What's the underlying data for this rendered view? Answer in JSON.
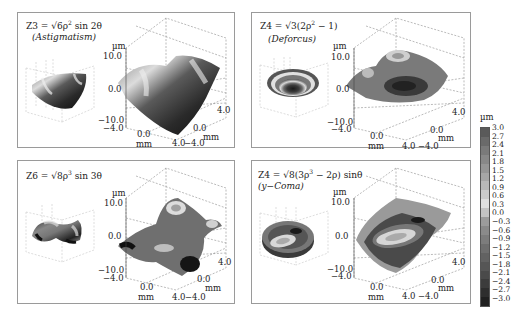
{
  "chart_data": {
    "type": "surface3d",
    "colorbar": {
      "label": "µm",
      "ticks": [
        "3.0",
        "2.7",
        "2.4",
        "2.1",
        "1.8",
        "1.5",
        "1.2",
        "0.9",
        "0.6",
        "0.3",
        "0.0",
        "-0.3",
        "-0.6",
        "-0.9",
        "-1.2",
        "-1.5",
        "-1.8",
        "-2.1",
        "-2.4",
        "-2.7",
        "-3.0"
      ],
      "range": [
        -3.0,
        3.0
      ],
      "colormap": "grayscale (dark = low, light = high)"
    },
    "panels": [
      {
        "position": "top-left",
        "equation": "Z3 = √6ρ² sin 2θ",
        "name": "(Astigmatism)",
        "zlabel": "µm",
        "zticks": [
          "10.0",
          "0.0",
          "-10.0"
        ],
        "zlim": [
          -10.0,
          10.0
        ],
        "xlabel": "mm",
        "xticks": [
          "-4.0",
          "0.0",
          "4.0"
        ],
        "xlim": [
          -4.0,
          4.0
        ],
        "ylabel": "mm",
        "yticks": [
          "4.0",
          "0.0",
          "-4.0"
        ],
        "ylim": [
          -4.0,
          4.0
        ]
      },
      {
        "position": "top-right",
        "equation": "Z4 = √3(2ρ² − 1)",
        "name": "(Deforcus)",
        "zlabel": "µm",
        "zticks": [
          "10.0",
          "0.0",
          "-10.0"
        ],
        "zlim": [
          -10.0,
          10.0
        ],
        "xlabel": "mm",
        "xticks": [
          "-4.0",
          "0.0",
          "4.0"
        ],
        "xlim": [
          -4.0,
          4.0
        ],
        "ylabel": "mm",
        "yticks": [
          "4.0",
          "0.0",
          "-4.0"
        ],
        "ylim": [
          -4.0,
          4.0
        ]
      },
      {
        "position": "bottom-left",
        "equation": "Z6 = √8ρ³ sin 3θ",
        "name": "",
        "zlabel": "µm",
        "zticks": [
          "10.0",
          "0.0",
          "-10.0"
        ],
        "zlim": [
          -10.0,
          10.0
        ],
        "xlabel": "mm",
        "xticks": [
          "-4.0",
          "0.0",
          "4.0"
        ],
        "xlim": [
          -4.0,
          4.0
        ],
        "ylabel": "mm",
        "yticks": [
          "4.0",
          "0.0",
          "-4.0"
        ],
        "ylim": [
          -4.0,
          4.0
        ]
      },
      {
        "position": "bottom-right",
        "equation": "Z4 = √8(3ρ³ − 2ρ) sinθ",
        "name": "(y−Coma)",
        "zlabel": "µm",
        "zticks": [
          "10.0",
          "0.0",
          "-10.0"
        ],
        "zlim": [
          -10.0,
          10.0
        ],
        "xlabel": "mm",
        "xticks": [
          "-4.0",
          "0.0",
          "4.0"
        ],
        "xlim": [
          -4.0,
          4.0
        ],
        "ylabel": "mm",
        "yticks": [
          "4.0",
          "0.0",
          "-4.0"
        ],
        "ylim": [
          -4.0,
          4.0
        ]
      }
    ]
  },
  "panels": [
    {
      "eq_lhs": "Z3 = √6ρ",
      "eq_sup": "2",
      "eq_rhs": " sin 2θ",
      "name": "(Astigmatism)",
      "zlabel": "µm",
      "z_hi": "10.0",
      "z_mid": "0.0",
      "z_lo": "−10.0",
      "x_lo": "−4.0",
      "x_mid": "0.0",
      "x_hi": "4.0",
      "x_unit": "mm",
      "y_hi": "4.0",
      "y_mid": "0.0",
      "y_lo": "−4.0",
      "y_unit": "mm"
    },
    {
      "eq_lhs": "Z4 = √3(2ρ",
      "eq_sup": "2",
      "eq_rhs": " − 1)",
      "name": "(Deforcus)",
      "zlabel": "µm",
      "z_hi": "10.0",
      "z_mid": "0.0",
      "z_lo": "−10.0",
      "x_lo": "−4.0",
      "x_mid": "0.0",
      "x_hi": "4.0",
      "x_unit": "mm",
      "y_hi": "4.0",
      "y_mid": "0.0",
      "y_lo": "−4.0",
      "y_unit": "mm"
    },
    {
      "eq_lhs": "Z6 = √8ρ",
      "eq_sup": "3",
      "eq_rhs": " sin 3θ",
      "name": "",
      "zlabel": "µm",
      "z_hi": "10.0",
      "z_mid": "0.0",
      "z_lo": "−10.0",
      "x_lo": "−4.0",
      "x_mid": "0.0",
      "x_hi": "4.0",
      "x_unit": "mm",
      "y_hi": "4.0",
      "y_mid": "0.0",
      "y_lo": "−4.0",
      "y_unit": "mm"
    },
    {
      "eq_lhs": "Z4 = √8(3ρ",
      "eq_sup": "3",
      "eq_rhs": " − 2ρ) sinθ",
      "name": "(y−Coma)",
      "zlabel": "µm",
      "z_hi": "10.0",
      "z_mid": "0.0",
      "z_lo": "−10.0",
      "x_lo": "−4.0",
      "x_mid": "0.0",
      "x_hi": "4.0",
      "x_unit": "mm",
      "y_hi": "4.0",
      "y_mid": "0.0",
      "y_lo": "−4.0",
      "y_unit": "mm"
    }
  ],
  "colorbar": {
    "unit": "µm",
    "ticks": [
      "3.0",
      "2.7",
      "2.4",
      "2.1",
      "1.8",
      "1.5",
      "1.2",
      "0.9",
      "0.6",
      "0.3",
      "0.0",
      "−0.3",
      "−0.6",
      "−0.9",
      "−1.2",
      "−1.5",
      "−1.8",
      "−2.1",
      "−2.4",
      "−2.7",
      "−3.0"
    ],
    "colors": [
      "#5a5a5a",
      "#6a6a6a",
      "#7a7a7a",
      "#888888",
      "#969696",
      "#a6a6a6",
      "#b8b8b8",
      "#cccccc",
      "#e0e0e0",
      "#c4c4c4",
      "#9c9c9c",
      "#8a8a8a",
      "#7c7c7c",
      "#6e6e6e",
      "#626262",
      "#565656",
      "#4a4a4a",
      "#3c3c3c",
      "#2e2e2e",
      "#202020"
    ]
  }
}
